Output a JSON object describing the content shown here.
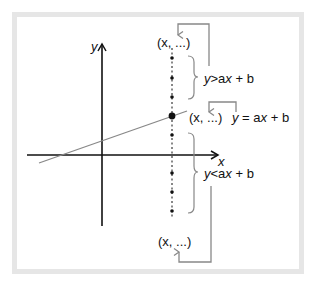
{
  "diagram": {
    "axes": {
      "x_label": "x",
      "y_label": "y"
    },
    "line": {
      "equation": "y = ax + b",
      "color": "#888888"
    },
    "points": {
      "top_label": "(x, ...)",
      "middle_label": "(x, ...)",
      "bottom_label": "(x, ...)"
    },
    "regions": {
      "above": {
        "y": "y",
        "op": ">",
        "rhs_a": "a",
        "rhs_x": "x",
        "rhs_rest": " + b"
      },
      "on": {
        "y": "y",
        "op": " = ",
        "rhs_a": "a",
        "rhs_x": "x",
        "rhs_rest": " + b"
      },
      "below": {
        "y": "y",
        "op": "<",
        "rhs_a": "a",
        "rhs_x": "x",
        "rhs_rest": " + b"
      }
    },
    "colors": {
      "axes": "#111111",
      "arrows": "#888888",
      "frame": "#e6e6e6"
    }
  }
}
